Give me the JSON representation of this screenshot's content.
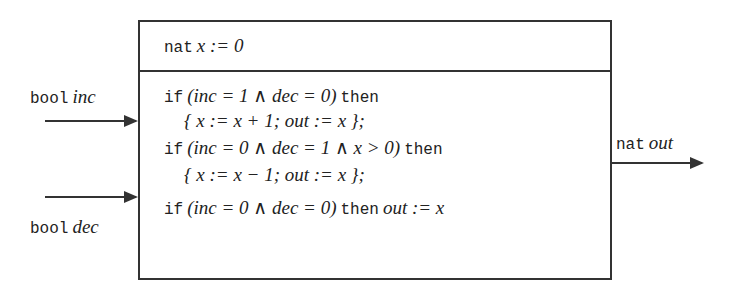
{
  "diagram": {
    "type": "component-block",
    "component": {
      "init": {
        "kw": "nat",
        "text": "x := 0"
      },
      "rules": [
        {
          "kw_if": "if",
          "cond": "(inc = 1 ∧ dec = 0)",
          "kw_then": "then",
          "body": "{ x := x + 1;  out := x };"
        },
        {
          "kw_if": "if",
          "cond": "(inc = 0 ∧ dec = 1 ∧ x > 0)",
          "kw_then": "then",
          "body": "{ x := x − 1;  out := x };"
        },
        {
          "kw_if": "if",
          "cond": "(inc = 0 ∧ dec = 0)",
          "kw_then": "then",
          "body": "out := x"
        }
      ]
    },
    "inputs": [
      {
        "type": "bool",
        "name": "inc"
      },
      {
        "type": "bool",
        "name": "dec"
      }
    ],
    "outputs": [
      {
        "type": "nat",
        "name": "out"
      }
    ]
  }
}
